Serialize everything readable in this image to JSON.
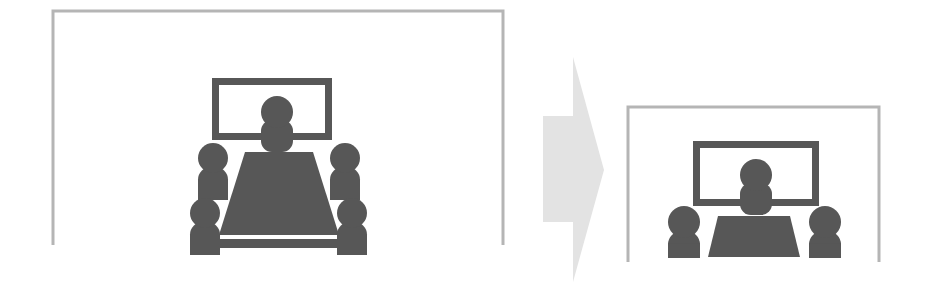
{
  "figure": {
    "title": "Meeting room downsizing diagram",
    "description": "A large conference room with four in-room participants and a remote presenter on a wall display transforms into a smaller conference room with two in-room participants and a remote presenter on a wall display.",
    "background_color": "#ffffff"
  },
  "colors": {
    "frame_stroke": "#b5b5b5",
    "figure_fill": "#575757",
    "screen_stroke": "#575757",
    "screen_fill": "#ffffff",
    "arrow_fill": "#e3e3e3",
    "canvas": "#ffffff"
  },
  "panels": [
    {
      "id": "before",
      "name": "large-meeting-room",
      "label": "Large meeting room",
      "frame": {
        "x": 53,
        "y": 11,
        "width": 450,
        "height": 234,
        "stroke_width": 3,
        "open_bottom": true
      },
      "display": {
        "name": "wall-display",
        "label": "Wall display",
        "x": 212,
        "y": 78,
        "width": 120,
        "height": 62,
        "border_width": 7
      },
      "remote_presenter": {
        "name": "remote-presenter",
        "label": "Remote presenter on screen",
        "head_cx": 277,
        "head_cy": 112,
        "head_r": 16,
        "body_x": 261,
        "body_y": 120,
        "body_width": 32,
        "body_height": 32
      },
      "table": {
        "name": "conference-table",
        "label": "Conference table",
        "top_left_x": 245,
        "top_right_x": 313,
        "top_y": 152,
        "bottom_left_x": 219,
        "bottom_right_x": 339,
        "bottom_y": 235,
        "base_y": 239,
        "base_height": 9
      },
      "participants": [
        {
          "name": "participant-back-left",
          "head_cx": 213,
          "head_cy": 158,
          "head_r": 15,
          "body_y": 167,
          "body_width": 30,
          "body_height": 33
        },
        {
          "name": "participant-back-right",
          "head_cx": 345,
          "head_cy": 158,
          "head_r": 15,
          "body_y": 167,
          "body_width": 30,
          "body_height": 33
        },
        {
          "name": "participant-front-left",
          "head_cx": 205,
          "head_cy": 213,
          "head_r": 15,
          "body_y": 222,
          "body_width": 30,
          "body_height": 33
        },
        {
          "name": "participant-front-right",
          "head_cx": 352,
          "head_cy": 213,
          "head_r": 15,
          "body_y": 222,
          "body_width": 30,
          "body_height": 33
        }
      ],
      "participant_count": 4
    },
    {
      "id": "after",
      "name": "small-meeting-room",
      "label": "Small meeting room",
      "frame": {
        "x": 628,
        "y": 107,
        "width": 251,
        "height": 155,
        "stroke_width": 3,
        "open_bottom": true
      },
      "display": {
        "name": "wall-display",
        "label": "Wall display",
        "x": 693,
        "y": 141,
        "width": 126,
        "height": 65,
        "border_width": 7
      },
      "remote_presenter": {
        "name": "remote-presenter",
        "label": "Remote presenter on screen",
        "head_cx": 756,
        "head_cy": 175,
        "head_r": 16,
        "body_x": 740,
        "body_y": 183,
        "body_width": 32,
        "body_height": 32
      },
      "table": {
        "name": "conference-table",
        "label": "Conference table",
        "top_left_x": 718,
        "top_right_x": 790,
        "top_y": 216,
        "bottom_left_x": 708,
        "bottom_right_x": 800,
        "bottom_y": 257,
        "base_y": 257,
        "base_height": 0
      },
      "participants": [
        {
          "name": "participant-left",
          "head_cx": 684,
          "head_cy": 222,
          "head_r": 16,
          "body_y": 231,
          "body_width": 32,
          "body_height": 27
        },
        {
          "name": "participant-right",
          "head_cx": 825,
          "head_cy": 222,
          "head_r": 16,
          "body_y": 231,
          "body_width": 32,
          "body_height": 27
        }
      ],
      "participant_count": 2
    }
  ],
  "arrow": {
    "name": "transform-arrow",
    "label": "transforms into",
    "direction": "right",
    "tip_x": 604,
    "tip_y": 170,
    "top_y": 57,
    "bottom_y": 282,
    "shaft_left_x": 543,
    "shaft_top_y": 116,
    "shaft_bottom_y": 222,
    "neck_x": 573
  }
}
